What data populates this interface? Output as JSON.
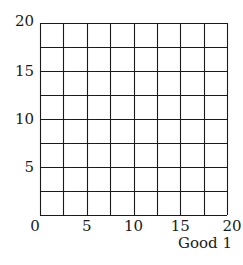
{
  "chart_data": {
    "type": "line",
    "title": "",
    "xlabel": "Good 1",
    "ylabel": "",
    "xlim": [
      0,
      20
    ],
    "ylim": [
      0,
      20
    ],
    "x_ticks": [
      0,
      5,
      10,
      15,
      20
    ],
    "y_ticks": [
      5,
      10,
      15,
      20
    ],
    "x_tick_labels": [
      "0",
      "5",
      "10",
      "15",
      "20"
    ],
    "y_tick_labels": [
      "5",
      "10",
      "15",
      "20"
    ],
    "grid": true,
    "grid_step": 2.5,
    "series": [],
    "legend": null
  },
  "colors": {
    "grid": "#1a1a1a",
    "text": "#1a1a1a",
    "background": "#ffffff"
  }
}
